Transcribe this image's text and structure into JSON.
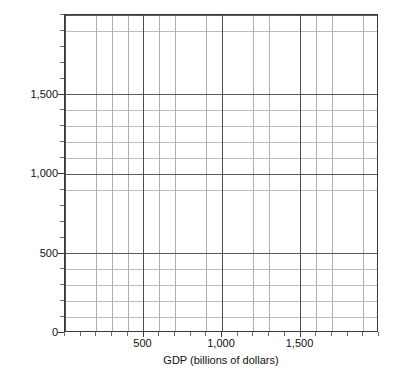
{
  "chart_data": {
    "type": "scatter",
    "title": "",
    "subtitle": "",
    "xlabel": "GDP (billions of dollars)",
    "ylabel": "Intended spending (millions of dollars)",
    "xlim": [
      0,
      2000
    ],
    "ylim": [
      0,
      2000
    ],
    "x_major_ticks": [
      500,
      1000,
      1500
    ],
    "y_major_ticks": [
      0,
      500,
      1000,
      1500
    ],
    "x_major_tick_labels": [
      "500",
      "1,000",
      "1,500"
    ],
    "y_major_tick_labels": [
      "0",
      "500",
      "1,000",
      "1,500"
    ],
    "x_minor_step": 100,
    "y_minor_step": 100,
    "grid": true,
    "grid_major_color": "#4d4d4d",
    "grid_minor_color": "#b8b8b8",
    "axis_color": "#3a3a3a",
    "legend": null,
    "legend_position": "none",
    "series": [],
    "values": [],
    "annotations": [],
    "note": "Blank grid / graph paper: axes and gridlines only, no plotted data"
  },
  "axes": {
    "x": {
      "label": "GDP (billions of dollars)",
      "ticks": [
        {
          "value": 500,
          "label": "500",
          "major": true
        },
        {
          "value": 1000,
          "label": "1,000",
          "major": true
        },
        {
          "value": 1500,
          "label": "1,500",
          "major": true
        }
      ]
    },
    "y": {
      "label": "Intended spending (millions of dollars)",
      "ticks": [
        {
          "value": 0,
          "label": "0",
          "major": true
        },
        {
          "value": 500,
          "label": "500",
          "major": true
        },
        {
          "value": 1000,
          "label": "1,000",
          "major": true
        },
        {
          "value": 1500,
          "label": "1,500",
          "major": true
        }
      ]
    }
  }
}
